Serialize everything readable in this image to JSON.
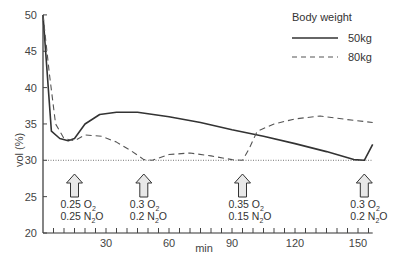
{
  "chart_data": {
    "type": "line",
    "title": "",
    "xlabel": "min",
    "ylabel": "vol (%)",
    "xlim": [
      0,
      157
    ],
    "ylim": [
      20,
      50
    ],
    "x_ticks": [
      30,
      60,
      90,
      120,
      150
    ],
    "y_ticks": [
      20,
      25,
      30,
      35,
      40,
      45,
      50
    ],
    "minor_x_tick_step": 5,
    "grid": false,
    "reference_line": {
      "y": 30,
      "style": "dotted"
    },
    "legend": {
      "title": "Body weight",
      "position": "upper right",
      "entries": [
        {
          "label": "50kg",
          "style": "solid"
        },
        {
          "label": "80kg",
          "style": "dashed"
        }
      ]
    },
    "series": [
      {
        "name": "50kg",
        "style": "solid",
        "x": [
          0,
          4,
          8,
          12,
          15,
          20,
          27,
          35,
          45,
          60,
          75,
          90,
          105,
          120,
          135,
          148,
          153,
          157
        ],
        "y": [
          50,
          34,
          33,
          32.7,
          33,
          35,
          36.3,
          36.6,
          36.6,
          36,
          35.2,
          34.2,
          33.3,
          32.3,
          31.2,
          30.1,
          30,
          32.2
        ]
      },
      {
        "name": "80kg",
        "style": "dashed",
        "x": [
          0,
          3,
          6,
          10,
          15,
          20,
          28,
          35,
          42,
          48,
          52,
          60,
          70,
          80,
          90,
          95,
          98,
          102,
          110,
          120,
          132,
          145,
          157
        ],
        "y": [
          50,
          42,
          35,
          33,
          32.7,
          33.5,
          33.3,
          32.5,
          31.3,
          30.1,
          30,
          30.8,
          31,
          30.6,
          30.1,
          30.0,
          31.5,
          34,
          35,
          35.7,
          36.1,
          35.6,
          35.2
        ]
      }
    ],
    "annotations": [
      {
        "x": 15,
        "type": "up-arrow",
        "lines": [
          "0.25 O2",
          "0.25 N2O"
        ]
      },
      {
        "x": 48,
        "type": "up-arrow",
        "lines": [
          "0.3 O2",
          "0.2 N2O"
        ]
      },
      {
        "x": 95,
        "type": "up-arrow",
        "lines": [
          "0.35 O2",
          "0.15 N2O"
        ]
      },
      {
        "x": 153,
        "type": "up-arrow",
        "lines": [
          "0.3 O2",
          "0.2 N2O"
        ]
      }
    ]
  },
  "labels": {
    "ylabel": "vol (%)",
    "xlabel": "min",
    "legend_title": "Body weight",
    "legend_50": "50kg",
    "legend_80": "80kg"
  },
  "annotations_text": [
    {
      "o2_val": "0.25 O",
      "n2o_val": "0.25 N",
      "sub": "2",
      "tail": "O"
    },
    {
      "o2_val": "0.3 O",
      "n2o_val": "0.2 N",
      "sub": "2",
      "tail": "O"
    },
    {
      "o2_val": "0.35 O",
      "n2o_val": "0.15 N",
      "sub": "2",
      "tail": "O"
    },
    {
      "o2_val": "0.3 O",
      "n2o_val": "0.2 N",
      "sub": "2",
      "tail": "O"
    }
  ]
}
